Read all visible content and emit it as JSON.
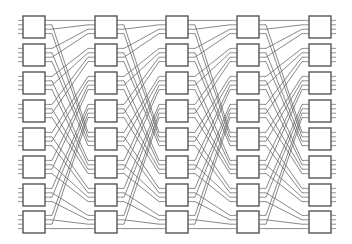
{
  "diagram": {
    "type": "multistage-interconnection-network",
    "stages": 5,
    "switches_per_stage": 8,
    "ports_per_switch": 4,
    "stage_x": [
      23,
      95,
      166,
      237,
      309
    ],
    "row_y": [
      16,
      44,
      72,
      100,
      128,
      156,
      184,
      211
    ],
    "box_width": 22,
    "box_height": 22,
    "stub_length": 5,
    "colors": {
      "box_stroke": "#555555",
      "wire": "#6a6a6a",
      "background": "#ffffff"
    },
    "permutation": "inverse-perfect-shuffle"
  }
}
